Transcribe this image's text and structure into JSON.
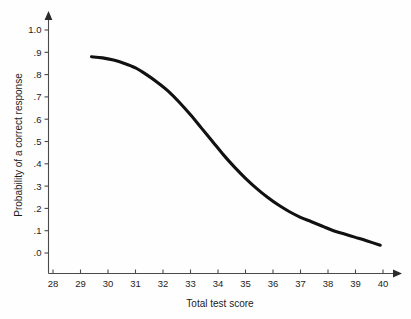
{
  "chart_data": {
    "type": "line",
    "title": "",
    "subtitle": "",
    "xlabel": "Total test score",
    "ylabel": "Probability of a correct response",
    "xlim": [
      28,
      40
    ],
    "ylim": [
      0.0,
      1.0
    ],
    "grid": false,
    "legend": false,
    "legend_position": "none",
    "x_ticks": [
      28,
      29,
      30,
      31,
      32,
      33,
      34,
      35,
      36,
      37,
      38,
      39,
      40
    ],
    "x_tick_labels": [
      "28",
      "29",
      "30",
      "31",
      "32",
      "33",
      "34",
      "35",
      "36",
      "37",
      "38",
      "39",
      "40"
    ],
    "y_ticks": [
      0.0,
      0.1,
      0.2,
      0.3,
      0.4,
      0.5,
      0.6,
      0.7,
      0.8,
      0.9,
      1.0
    ],
    "y_tick_labels": [
      ".0",
      ".1",
      ".2",
      ".3",
      ".4",
      ".5",
      ".6",
      ".7",
      ".8",
      ".9",
      "1.0"
    ],
    "axis_style": "arrow-tipped",
    "series": [
      {
        "name": "Item characteristic curve",
        "color": "#111111",
        "line_width": 3.1,
        "x": [
          29.4,
          29.8,
          30.2,
          30.6,
          31.0,
          31.4,
          31.8,
          32.2,
          32.6,
          33.0,
          33.4,
          33.8,
          34.2,
          34.6,
          35.0,
          35.4,
          35.8,
          36.2,
          36.6,
          37.0,
          37.4,
          37.8,
          38.2,
          38.6,
          39.0,
          39.4,
          39.9
        ],
        "values": [
          0.88,
          0.875,
          0.865,
          0.85,
          0.83,
          0.8,
          0.765,
          0.725,
          0.675,
          0.62,
          0.56,
          0.5,
          0.44,
          0.385,
          0.335,
          0.29,
          0.25,
          0.215,
          0.185,
          0.16,
          0.14,
          0.12,
          0.1,
          0.085,
          0.07,
          0.055,
          0.035
        ]
      }
    ]
  },
  "annotations": {
    "y_axis_title": "Probability of a correct response",
    "x_axis_title": "Total test score"
  },
  "colors": {
    "background": "#fefefe",
    "curve": "#111111",
    "axis": "#4a4a4a",
    "text": "#1c1c1c"
  }
}
